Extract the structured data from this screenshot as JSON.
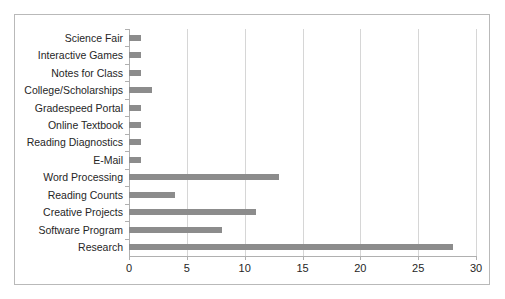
{
  "chart_data": {
    "type": "bar",
    "orientation": "horizontal",
    "title": "",
    "subtitle": "",
    "xlabel": "",
    "ylabel": "",
    "categories": [
      "Science Fair",
      "Interactive Games",
      "Notes for Class",
      "College/Scholarships",
      "Gradespeed Portal",
      "Online Textbook",
      "Reading Diagnostics",
      "E-Mail",
      "Word Processing",
      "Reading Counts",
      "Creative Projects",
      "Software Program",
      "Research"
    ],
    "values": [
      1,
      1,
      1,
      2,
      1,
      1,
      1,
      1,
      13,
      4,
      11,
      8,
      28
    ],
    "xlim": [
      0,
      30
    ],
    "xticks": [
      0,
      5,
      10,
      15,
      20,
      25,
      30
    ],
    "xtick_labels": [
      "0",
      "5",
      "10",
      "15",
      "20",
      "25",
      "30"
    ],
    "grid": true,
    "legend": false,
    "bar_color": "#8c8c8c",
    "gridline_color": "#d6d6d6",
    "axis_color": "#b0b0b0",
    "border_color": "#b9b9b9",
    "background_color": "#ffffff"
  }
}
